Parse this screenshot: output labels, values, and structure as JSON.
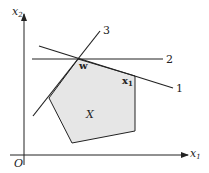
{
  "diagram": {
    "axes": {
      "x_label": "x",
      "x_sub": "1",
      "y_label": "x",
      "y_sub": "2",
      "origin_label": "O"
    },
    "lines": [
      {
        "id": "1",
        "label": "1"
      },
      {
        "id": "2",
        "label": "2"
      },
      {
        "id": "3",
        "label": "3"
      }
    ],
    "region_label": "X",
    "points": {
      "w": {
        "label": "w"
      },
      "x1": {
        "label": "x",
        "sub": "1"
      }
    },
    "colors": {
      "region_fill": "#e6e6e6",
      "stroke": "#222222"
    }
  }
}
